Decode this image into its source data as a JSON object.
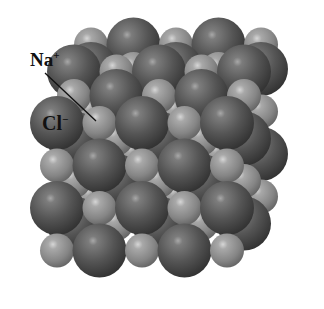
{
  "figure": {
    "labels": {
      "na": {
        "text": "Na",
        "charge": "+"
      },
      "cl": {
        "text": "Cl",
        "charge": "−"
      }
    },
    "colors": {
      "background": "#ffffff",
      "cl_dark": "#3e3e3e",
      "cl_mid": "#6a6a6a",
      "cl_light": "#a8a8a8",
      "na_dark": "#6e6e6e",
      "na_mid": "#9a9a9a",
      "na_light": "#d2d2d2",
      "leader_line": "#111111"
    },
    "lattice": {
      "grid": 5,
      "layers": 3,
      "cl_radius": 27,
      "na_radius": 17,
      "spacing": 42.5,
      "origin_x": 57,
      "origin_y": 123,
      "layer_shift_x": 17,
      "layer_shift_y": -27
    }
  }
}
